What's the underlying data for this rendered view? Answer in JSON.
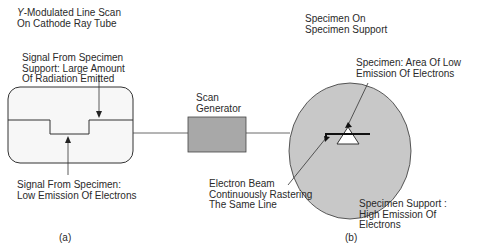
{
  "labels": {
    "crt_title_italic": "Y",
    "crt_title_rest": "-Modulated Line Scan\nOn Cathode Ray Tube",
    "support_signal": "Signal From Specimen\nSupport: Large Amount\nOf Radiation Emitted",
    "specimen_signal": "Signal From Specimen:\nLow Emission Of Electrons",
    "scan_generator": "Scan\nGenerator",
    "specimen_on_support": "Specimen On\nSpecimen Support",
    "specimen_area": "Specimen: Area Of Low\nEmission Of Electrons",
    "electron_beam": "Electron Beam\nContinuously Rastering\nThe Same Line",
    "support_high": "Specimen Support :\nHigh Emission Of\nElectrons",
    "caption_a": "(a)",
    "caption_b": "(b)"
  },
  "colors": {
    "stroke": "#333333",
    "fill_gray": "#c8c8c8",
    "crt_fill": "#f7f7f7",
    "generator_fill": "#a8a8a8"
  }
}
